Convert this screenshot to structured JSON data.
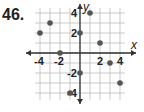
{
  "problem_number": "46.",
  "chart_data": {
    "type": "scatter",
    "title": "",
    "xlabel": "x",
    "ylabel": "y",
    "xlim": [
      -5,
      5
    ],
    "ylim": [
      -5,
      5
    ],
    "grid": true,
    "x_ticks": [
      "-4",
      "-2",
      "2",
      "4"
    ],
    "y_ticks": [
      "4",
      "2",
      "-2",
      "-4"
    ],
    "points": [
      {
        "x": -4,
        "y": 2
      },
      {
        "x": -3,
        "y": 3
      },
      {
        "x": -2,
        "y": 0
      },
      {
        "x": 0,
        "y": 2
      },
      {
        "x": 1,
        "y": 4
      },
      {
        "x": 2,
        "y": 1
      },
      {
        "x": 3,
        "y": -1
      },
      {
        "x": 4,
        "y": -3
      },
      {
        "x": 0,
        "y": -2
      },
      {
        "x": -1,
        "y": -4
      }
    ]
  }
}
